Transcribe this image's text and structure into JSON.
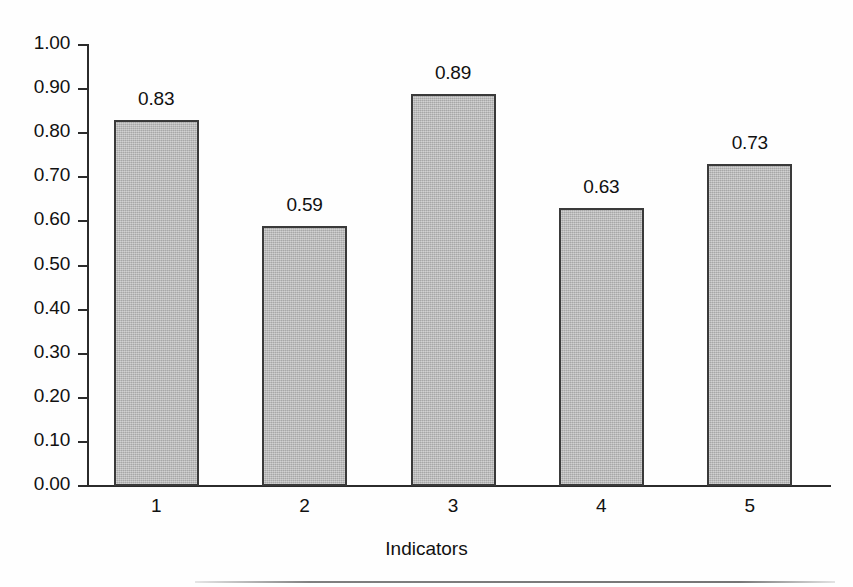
{
  "chart_data": {
    "type": "bar",
    "title": "",
    "subtitle": "",
    "xlabel": "Indicators",
    "ylabel": "",
    "categories": [
      "1",
      "2",
      "3",
      "4",
      "5"
    ],
    "values": [
      0.83,
      0.59,
      0.89,
      0.63,
      0.73
    ],
    "value_labels": [
      "0.83",
      "0.59",
      "0.89",
      "0.63",
      "0.73"
    ],
    "ylim": [
      0.0,
      1.0
    ],
    "ytick_labels": [
      "1.00",
      "0.90",
      "0.80",
      "0.70",
      "0.60",
      "0.50",
      "0.40",
      "0.30",
      "0.20",
      "0.10",
      "0.00"
    ],
    "ytick_values": [
      1.0,
      0.9,
      0.8,
      0.7,
      0.6,
      0.5,
      0.4,
      0.3,
      0.2,
      0.1,
      0.0
    ],
    "grid": false,
    "legend": false,
    "legend_position": "none",
    "bar_fill_color": "#b7b7b7",
    "bar_border_color": "#3a3a3a",
    "axis_color": "#2b2b2b",
    "text_color": "#111111",
    "background_color": "#ffffff"
  }
}
